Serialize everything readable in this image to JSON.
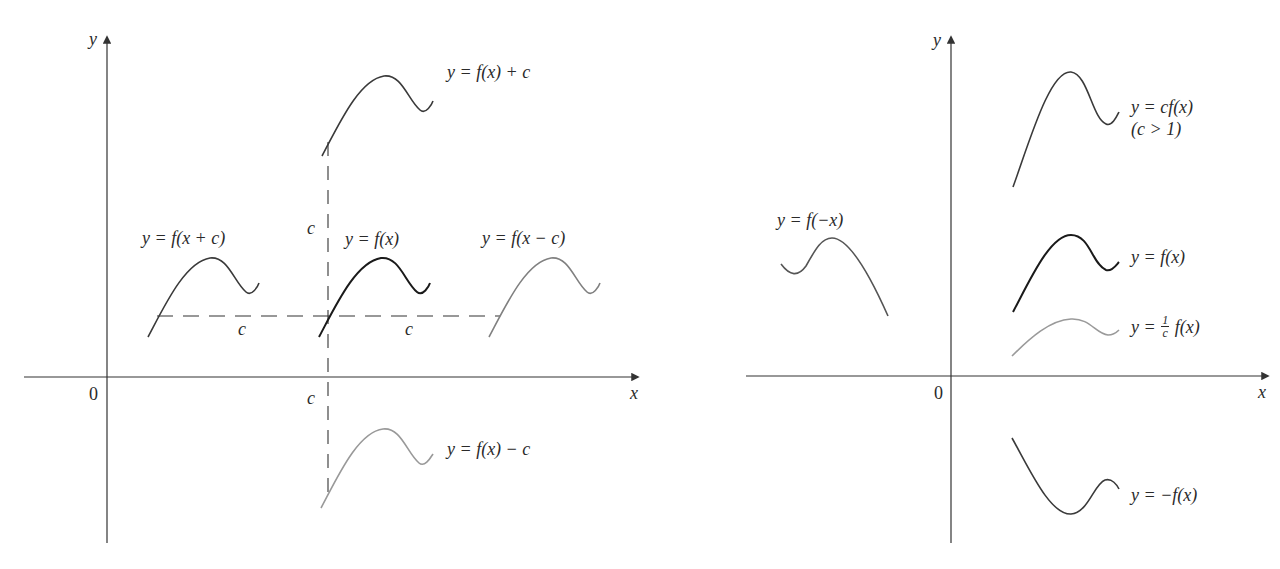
{
  "left_panel": {
    "title": "Vertical and horizontal shifts",
    "axes": {
      "x_label": "x",
      "y_label": "y",
      "origin_label": "0"
    },
    "shift_labels": {
      "c_vertical_up": "c",
      "c_vertical_down": "c",
      "c_horizontal_left": "c",
      "c_horizontal_right": "c"
    },
    "curves": [
      {
        "id": "f_x_plus_c",
        "label": "y = f(x + c)",
        "shade": "dark-gray",
        "color": "#3a3a3a"
      },
      {
        "id": "f_x",
        "label": "y = f(x)",
        "shade": "black",
        "color": "#1a1a1a"
      },
      {
        "id": "f_x_minus_c",
        "label": "y = f(x − c)",
        "shade": "gray",
        "color": "#808080"
      },
      {
        "id": "f_x_shift_up",
        "label": "y = f(x) + c",
        "shade": "dark-gray",
        "color": "#3a3a3a"
      },
      {
        "id": "f_x_shift_down",
        "label": "y = f(x) − c",
        "shade": "light-gray",
        "color": "#999999"
      }
    ]
  },
  "right_panel": {
    "title": "Stretching and reflecting",
    "axes": {
      "x_label": "x",
      "y_label": "y",
      "origin_label": "0"
    },
    "curves": [
      {
        "id": "c_f_x",
        "label": "y = cf(x)",
        "sublabel": "(c > 1)",
        "shade": "dark-gray",
        "color": "#3a3a3a"
      },
      {
        "id": "f_x",
        "label": "y = f(x)",
        "shade": "black",
        "color": "#1a1a1a"
      },
      {
        "id": "inv_c_f_x",
        "label_prefix": "y = ",
        "frac_num": "1",
        "frac_den": "c",
        "label_suffix": "f(x)",
        "shade": "light-gray",
        "color": "#9a9a9a"
      },
      {
        "id": "f_neg_x",
        "label": "y = f(−x)",
        "shade": "gray",
        "color": "#555555"
      },
      {
        "id": "neg_f_x",
        "label": "y = −f(x)",
        "shade": "dark-gray",
        "color": "#3a3a3a"
      }
    ]
  },
  "colors": {
    "axis": "#333333",
    "dashed": "#333333",
    "text": "#2a2a2a",
    "background": "#ffffff"
  }
}
